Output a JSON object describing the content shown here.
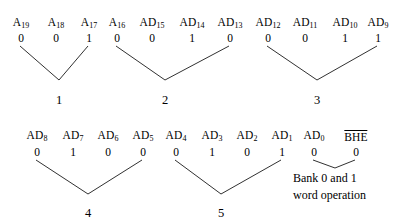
{
  "figure": {
    "type": "signal-grouping-diagram",
    "line_color": "#1a1a1a",
    "text_color": "#000000",
    "background": "#ffffff"
  },
  "groups": [
    {
      "id": "group-1",
      "digit": "1",
      "digit_x": 59,
      "digit_y": 94,
      "vertex_x": 59,
      "vertex_y": 80,
      "signals": [
        {
          "name": "A",
          "sub": "19",
          "bit": "0",
          "x": 21,
          "label_y": 17,
          "bit_y": 33
        },
        {
          "name": "A",
          "sub": "18",
          "bit": "0",
          "x": 56,
          "label_y": 17,
          "bit_y": 33
        },
        {
          "name": "A",
          "sub": "17",
          "bit": "1",
          "x": 89,
          "label_y": 17,
          "bit_y": 33
        }
      ],
      "connector_from": [
        0,
        2
      ]
    },
    {
      "id": "group-2",
      "digit": "2",
      "digit_x": 165,
      "digit_y": 94,
      "vertex_x": 165,
      "vertex_y": 80,
      "signals": [
        {
          "name": "A",
          "sub": "16",
          "bit": "0",
          "x": 117,
          "label_y": 17,
          "bit_y": 33
        },
        {
          "name": "AD",
          "sub": "15",
          "bit": "0",
          "x": 152,
          "label_y": 17,
          "bit_y": 33
        },
        {
          "name": "AD",
          "sub": "14",
          "bit": "1",
          "x": 192,
          "label_y": 17,
          "bit_y": 33
        },
        {
          "name": "AD",
          "sub": "13",
          "bit": "0",
          "x": 230,
          "label_y": 17,
          "bit_y": 33
        }
      ],
      "connector_from": [
        0,
        3
      ]
    },
    {
      "id": "group-3",
      "digit": "3",
      "digit_x": 317,
      "digit_y": 94,
      "vertex_x": 317,
      "vertex_y": 80,
      "signals": [
        {
          "name": "AD",
          "sub": "12",
          "bit": "0",
          "x": 268,
          "label_y": 17,
          "bit_y": 33
        },
        {
          "name": "AD",
          "sub": "11",
          "bit": "0",
          "x": 305,
          "label_y": 17,
          "bit_y": 33
        },
        {
          "name": "AD",
          "sub": "10",
          "bit": "1",
          "x": 345,
          "label_y": 17,
          "bit_y": 33
        },
        {
          "name": "AD",
          "sub": "9",
          "bit": "1",
          "x": 378,
          "label_y": 17,
          "bit_y": 33
        }
      ],
      "connector_from": [
        0,
        3
      ]
    },
    {
      "id": "group-4",
      "digit": "4",
      "digit_x": 88,
      "digit_y": 207,
      "vertex_x": 88,
      "vertex_y": 194,
      "signals": [
        {
          "name": "AD",
          "sub": "8",
          "bit": "0",
          "x": 37,
          "label_y": 130,
          "bit_y": 147
        },
        {
          "name": "AD",
          "sub": "7",
          "bit": "1",
          "x": 73,
          "label_y": 130,
          "bit_y": 147
        },
        {
          "name": "AD",
          "sub": "6",
          "bit": "0",
          "x": 108,
          "label_y": 130,
          "bit_y": 147
        },
        {
          "name": "AD",
          "sub": "5",
          "bit": "0",
          "x": 143,
          "label_y": 130,
          "bit_y": 147
        }
      ],
      "connector_from": [
        0,
        3
      ]
    },
    {
      "id": "group-5",
      "digit": "5",
      "digit_x": 221,
      "digit_y": 207,
      "vertex_x": 221,
      "vertex_y": 194,
      "signals": [
        {
          "name": "AD",
          "sub": "4",
          "bit": "0",
          "x": 176,
          "label_y": 130,
          "bit_y": 147
        },
        {
          "name": "AD",
          "sub": "3",
          "bit": "1",
          "x": 212,
          "label_y": 130,
          "bit_y": 147
        },
        {
          "name": "AD",
          "sub": "2",
          "bit": "0",
          "x": 247,
          "label_y": 130,
          "bit_y": 147
        },
        {
          "name": "AD",
          "sub": "1",
          "bit": "1",
          "x": 282,
          "label_y": 130,
          "bit_y": 147
        }
      ],
      "connector_from": [
        0,
        3
      ]
    }
  ],
  "bank_group": {
    "id": "bank-group",
    "signals": [
      {
        "name": "AD",
        "sub": "0",
        "bit": "0",
        "x": 314,
        "label_y": 130,
        "bit_y": 147,
        "overbar": false
      },
      {
        "name": "BHE",
        "sub": "",
        "bit": "0",
        "x": 356,
        "label_y": 130,
        "bit_y": 147,
        "overbar": true
      }
    ],
    "vertex_x": 335,
    "vertex_y": 168,
    "note_lines": [
      {
        "text": "Bank 0 and 1",
        "x": 293,
        "y": 172
      },
      {
        "text": "word operation",
        "x": 293,
        "y": 189
      }
    ]
  },
  "hex_value": "12345"
}
